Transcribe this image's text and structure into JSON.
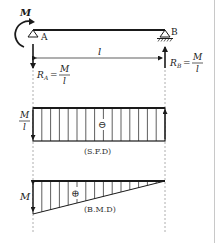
{
  "diagram": {
    "beam": {
      "moment_label": "M",
      "support_a_label": "A",
      "support_b_label": "B",
      "span_label": "l"
    },
    "reactions": {
      "ra": {
        "symbol": "R",
        "sub": "A",
        "eq": "=",
        "num": "M",
        "den": "l"
      },
      "rb": {
        "symbol": "R",
        "sub": "B",
        "eq": "=",
        "num": "M",
        "den": "l"
      }
    },
    "sfd": {
      "value_num": "M",
      "value_den": "l",
      "sign": "⊖",
      "caption": "(S.F.D)"
    },
    "bmd": {
      "value": "M",
      "sign": "⊕",
      "caption": "(B.M.D)"
    },
    "colors": {
      "line": "#1a1a1a",
      "dotted": "#9a9a9a",
      "border": "#c8c8c8"
    }
  }
}
